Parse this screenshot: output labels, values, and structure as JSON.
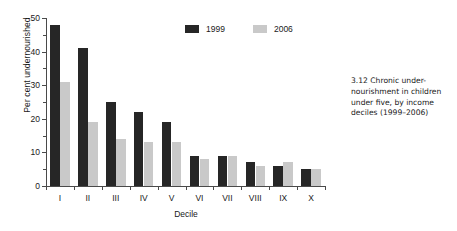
{
  "caption": {
    "number": "3.12",
    "text": "Chronic under-nourishment in children under five, by income deciles (1999–2006)",
    "full": "3.12  Chronic under-nourishment in children under five, by income deciles (1999–2006)"
  },
  "legend": {
    "position": "top-center",
    "items": [
      {
        "label": "1999",
        "color": "#262626"
      },
      {
        "label": "2006",
        "color": "#c9c9c9"
      }
    ]
  },
  "axes": {
    "y_title": "Per cent undernourished",
    "x_title": "Decile",
    "y_ticks": [
      "0",
      "10",
      "20",
      "30",
      "40",
      "50"
    ],
    "x_ticks": [
      "I",
      "II",
      "III",
      "IV",
      "V",
      "VI",
      "VII",
      "VIII",
      "IX",
      "X"
    ]
  },
  "chart_data": {
    "type": "bar",
    "title": "",
    "subtitle": "",
    "categories": [
      "I",
      "II",
      "III",
      "IV",
      "V",
      "VI",
      "VII",
      "VIII",
      "IX",
      "X"
    ],
    "series": [
      {
        "name": "1999",
        "color": "#262626",
        "values": [
          48,
          41,
          25,
          22,
          19,
          9,
          9,
          7,
          6,
          5
        ]
      },
      {
        "name": "2006",
        "color": "#c9c9c9",
        "values": [
          31,
          19,
          14,
          13,
          13,
          8,
          9,
          6,
          7,
          5
        ]
      }
    ],
    "xlabel": "Decile",
    "ylabel": "Per cent undernourished",
    "ylim": [
      0,
      50
    ],
    "ytick_step": 10,
    "yminor_step": 5,
    "grid": false,
    "legend_position": "top-center"
  },
  "colors": {
    "series_1999": "#262626",
    "series_2006": "#c9c9c9",
    "axis": "#4a4a4a",
    "text": "#1a1a1a",
    "background": "#ffffff"
  }
}
